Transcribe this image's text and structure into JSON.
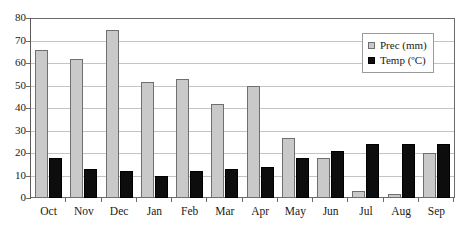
{
  "chart_data": {
    "type": "bar",
    "title": "",
    "xlabel": "",
    "ylabel": "",
    "ylim": [
      0,
      80
    ],
    "yticks": [
      0,
      10,
      20,
      30,
      40,
      50,
      60,
      70,
      80
    ],
    "grid": true,
    "legend_position": "top-right",
    "categories": [
      "Oct",
      "Nov",
      "Dec",
      "Jan",
      "Feb",
      "Mar",
      "Apr",
      "May",
      "Jun",
      "Jul",
      "Aug",
      "Sep"
    ],
    "series": [
      {
        "name": "Prec (mm)",
        "color": "#c9c9c9",
        "values": [
          66,
          62,
          75,
          52,
          53,
          42,
          50,
          27,
          18,
          3,
          2,
          20
        ]
      },
      {
        "name": "Temp (ºC)",
        "color": "#0d0d0d",
        "values": [
          18,
          13,
          12,
          10,
          12,
          13,
          14,
          18,
          21,
          24,
          24,
          24
        ]
      }
    ]
  },
  "legend": {
    "items": [
      {
        "label": "Prec (mm)",
        "swatch": "prec-swatch-icon"
      },
      {
        "label": "Temp (ºC)",
        "swatch": "temp-swatch-icon"
      }
    ]
  }
}
